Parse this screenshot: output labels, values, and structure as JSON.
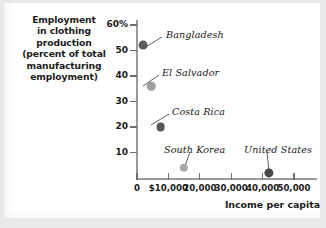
{
  "chart_data": {
    "type": "scatter",
    "title": "",
    "ylabel": "Employment in clothing production (percent of total manufacturing employment)",
    "ylabel_lines": [
      "Employment",
      "in clothing",
      "production",
      "(percent of total",
      "manufacturing",
      "employment)"
    ],
    "xlabel": "Income per capita",
    "xlim": [
      0,
      55000
    ],
    "ylim": [
      0,
      62
    ],
    "grid": false,
    "legend": "none",
    "ytick_labels": [
      "60%",
      "50",
      "40",
      "30",
      "20",
      "10"
    ],
    "ytick_values": [
      60,
      50,
      40,
      30,
      20,
      10
    ],
    "xtick_labels": [
      "0",
      "$10,000",
      "20,000",
      "30,000",
      "40,000",
      "50,000"
    ],
    "xtick_values": [
      0,
      10000,
      20000,
      30000,
      40000,
      50000
    ],
    "points": [
      {
        "label": "Bangladesh",
        "x": 2000,
        "y": 52,
        "color": "#5a5a5a",
        "radius": 4.4,
        "label_x": 162,
        "label_y": 26,
        "leader": [
          158,
          34,
          140,
          45
        ]
      },
      {
        "label": "El Salvador",
        "x": 4500,
        "y": 36,
        "color": "#9e9e9e",
        "radius": 4.2,
        "label_x": 158,
        "label_y": 64,
        "leader": [
          155,
          72,
          139,
          83
        ]
      },
      {
        "label": "Costa Rica",
        "x": 7500,
        "y": 20,
        "color": "#575757",
        "radius": 4.4,
        "label_x": 168,
        "label_y": 103,
        "leader": [
          165,
          111,
          147,
          122
        ]
      },
      {
        "label": "South Korea",
        "x": 15000,
        "y": 4,
        "color": "#a9a9a9",
        "radius": 4.2,
        "label_x": 160,
        "label_y": 141,
        "leader": [
          186,
          149,
          181,
          163
        ]
      },
      {
        "label": "United States",
        "x": 42000,
        "y": 2,
        "color": "#474747",
        "radius": 4.6,
        "label_x": 240,
        "label_y": 141,
        "leader": [
          263,
          149,
          265,
          168
        ]
      }
    ],
    "colors": {
      "axis": "#9a9a9a",
      "tick": "#6e6e6e",
      "text": "#1b1b1b",
      "annotation": "#171717",
      "panel_background": "#ffffff",
      "page_background": "#e9e9e7"
    }
  }
}
